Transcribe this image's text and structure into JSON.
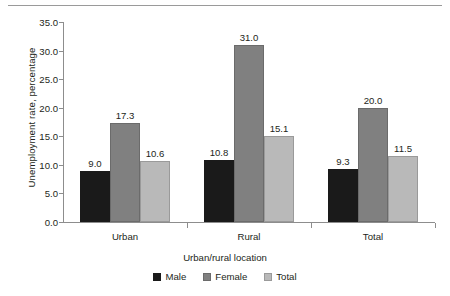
{
  "chart_data": {
    "type": "bar",
    "title": "",
    "xlabel": "Urban/rural location",
    "ylabel": "Unemployment rate, percentage",
    "categories": [
      "Urban",
      "Rural",
      "Total"
    ],
    "series": [
      {
        "name": "Male",
        "color": "#1a1a1a",
        "values": [
          9.0,
          10.8,
          9.3
        ]
      },
      {
        "name": "Female",
        "color": "#808080",
        "values": [
          17.3,
          31.0,
          20.0
        ]
      },
      {
        "name": "Total",
        "color": "#b9b9b9",
        "values": [
          10.6,
          15.1,
          11.5
        ]
      }
    ],
    "value_labels": [
      [
        "9.0",
        "17.3",
        "10.6"
      ],
      [
        "10.8",
        "31.0",
        "15.1"
      ],
      [
        "9.3",
        "20.0",
        "11.5"
      ]
    ],
    "ylim": [
      0.0,
      35.0
    ],
    "ytick_step": 5.0,
    "ytick_labels": [
      "35.0",
      "30.0",
      "25.0",
      "20.0",
      "15.0",
      "10.0",
      "5.0",
      "0.0"
    ],
    "grid": false,
    "legend_position": "bottom",
    "legend_entries": [
      "Male",
      "Female",
      "Total"
    ],
    "axis_color": "#8d8d8d"
  }
}
